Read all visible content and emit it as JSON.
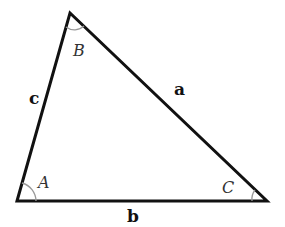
{
  "diagram": {
    "type": "triangle",
    "vertices": {
      "A": {
        "x": 17,
        "y": 201
      },
      "B": {
        "x": 70,
        "y": 13
      },
      "C": {
        "x": 267,
        "y": 201
      }
    },
    "angle_labels": {
      "A": "A",
      "B": "B",
      "C": "C"
    },
    "side_labels": {
      "a": "a",
      "b": "b",
      "c": "c"
    },
    "colors": {
      "stroke": "#111111",
      "arc": "#999999",
      "background": "#ffffff"
    }
  }
}
